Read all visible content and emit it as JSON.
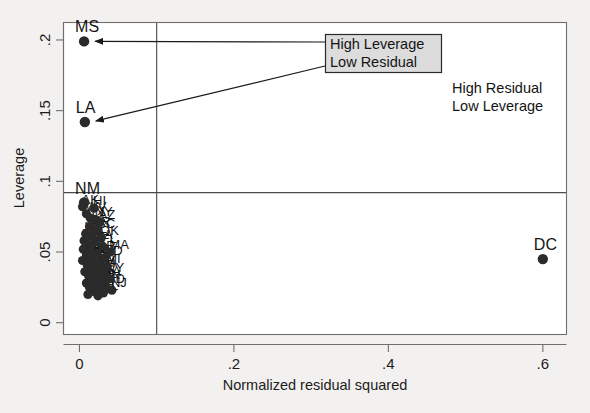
{
  "chart_data": {
    "type": "scatter",
    "title": "",
    "xlabel": "Normalized residual squared",
    "ylabel": "Leverage",
    "xlim": [
      -0.02,
      0.63
    ],
    "ylim": [
      -0.008,
      0.212
    ],
    "xticks": [
      0,
      0.2,
      0.4,
      0.6
    ],
    "xticklabels": [
      "0",
      ".2",
      ".4",
      ".6"
    ],
    "yticks": [
      0,
      0.05,
      0.1,
      0.15,
      0.2
    ],
    "yticklabels": [
      "0",
      ".05",
      ".1",
      ".15",
      ".2"
    ],
    "grid": false,
    "legend": "none",
    "reference_lines": [
      {
        "orientation": "horizontal",
        "value": 0.092,
        "name": "mean-leverage-line"
      },
      {
        "orientation": "vertical",
        "value": 0.1,
        "name": "mean-residual-line"
      }
    ],
    "labeled_points": [
      {
        "label": "MS",
        "x": 0.006,
        "y": 0.199
      },
      {
        "label": "LA",
        "x": 0.007,
        "y": 0.142
      },
      {
        "label": "NM",
        "x": 0.006,
        "y": 0.085
      },
      {
        "label": "DC",
        "x": 0.6,
        "y": 0.045
      }
    ],
    "cluster_points": [
      {
        "label": "AK",
        "x": 0.004,
        "y": 0.082
      },
      {
        "label": "HI",
        "x": 0.019,
        "y": 0.081
      },
      {
        "label": "WV",
        "x": 0.009,
        "y": 0.077
      },
      {
        "label": "TX",
        "x": 0.014,
        "y": 0.074
      },
      {
        "label": "NY",
        "x": 0.021,
        "y": 0.073
      },
      {
        "label": "AZ",
        "x": 0.026,
        "y": 0.071
      },
      {
        "label": "CA",
        "x": 0.013,
        "y": 0.068
      },
      {
        "label": "AR",
        "x": 0.018,
        "y": 0.066
      },
      {
        "label": "SC",
        "x": 0.024,
        "y": 0.065
      },
      {
        "label": "KY",
        "x": 0.008,
        "y": 0.063
      },
      {
        "label": "AL",
        "x": 0.016,
        "y": 0.061
      },
      {
        "label": "OK",
        "x": 0.028,
        "y": 0.06
      },
      {
        "label": "TN",
        "x": 0.006,
        "y": 0.058
      },
      {
        "label": "GA",
        "x": 0.02,
        "y": 0.057
      },
      {
        "label": "NC",
        "x": 0.011,
        "y": 0.055
      },
      {
        "label": "FL",
        "x": 0.03,
        "y": 0.054
      },
      {
        "label": "MT",
        "x": 0.005,
        "y": 0.052
      },
      {
        "label": "ID",
        "x": 0.015,
        "y": 0.051
      },
      {
        "label": "MA",
        "x": 0.04,
        "y": 0.05
      },
      {
        "label": "OR",
        "x": 0.023,
        "y": 0.049
      },
      {
        "label": "ME",
        "x": 0.009,
        "y": 0.048
      },
      {
        "label": "SD",
        "x": 0.017,
        "y": 0.047
      },
      {
        "label": "ND",
        "x": 0.033,
        "y": 0.046
      },
      {
        "label": "MO",
        "x": 0.012,
        "y": 0.045
      },
      {
        "label": "VT",
        "x": 0.004,
        "y": 0.044
      },
      {
        "label": "RI",
        "x": 0.026,
        "y": 0.043
      },
      {
        "label": "NV",
        "x": 0.019,
        "y": 0.042
      },
      {
        "label": "IN",
        "x": 0.01,
        "y": 0.041
      },
      {
        "label": "MI",
        "x": 0.036,
        "y": 0.04
      },
      {
        "label": "OH",
        "x": 0.022,
        "y": 0.039
      },
      {
        "label": "IL",
        "x": 0.014,
        "y": 0.038
      },
      {
        "label": "PA",
        "x": 0.029,
        "y": 0.037
      },
      {
        "label": "WA",
        "x": 0.007,
        "y": 0.036
      },
      {
        "label": "DE",
        "x": 0.018,
        "y": 0.035
      },
      {
        "label": "WY",
        "x": 0.032,
        "y": 0.034
      },
      {
        "label": "NE",
        "x": 0.012,
        "y": 0.033
      },
      {
        "label": "KS",
        "x": 0.025,
        "y": 0.032
      },
      {
        "label": "IA",
        "x": 0.039,
        "y": 0.031
      },
      {
        "label": "CO",
        "x": 0.016,
        "y": 0.03
      },
      {
        "label": "MN",
        "x": 0.028,
        "y": 0.029
      },
      {
        "label": "WI",
        "x": 0.009,
        "y": 0.028
      },
      {
        "label": "VA",
        "x": 0.021,
        "y": 0.027
      },
      {
        "label": "MD",
        "x": 0.034,
        "y": 0.026
      },
      {
        "label": "NH",
        "x": 0.013,
        "y": 0.025
      },
      {
        "label": "UT",
        "x": 0.027,
        "y": 0.024
      },
      {
        "label": "NJ",
        "x": 0.042,
        "y": 0.023
      },
      {
        "label": "CT",
        "x": 0.019,
        "y": 0.022
      },
      {
        "label": "AL2",
        "x": 0.031,
        "y": 0.021
      },
      {
        "label": "MS2",
        "x": 0.011,
        "y": 0.02
      },
      {
        "label": "SD2",
        "x": 0.024,
        "y": 0.019
      }
    ]
  },
  "annotations": {
    "boxed": {
      "line1": "High Leverage",
      "line2": "Low Residual"
    },
    "plain": {
      "line1": "High Residual",
      "line2": "Low Leverage"
    }
  },
  "colors": {
    "background": "#f3f1ef",
    "plot_area": "#ffffff",
    "point": "#2b2b2b",
    "frame": "#6f6f6f",
    "refline": "#4a4a4a",
    "annot_box_fill": "#dcdcdc",
    "annot_box_border": "#2a2a2a"
  }
}
